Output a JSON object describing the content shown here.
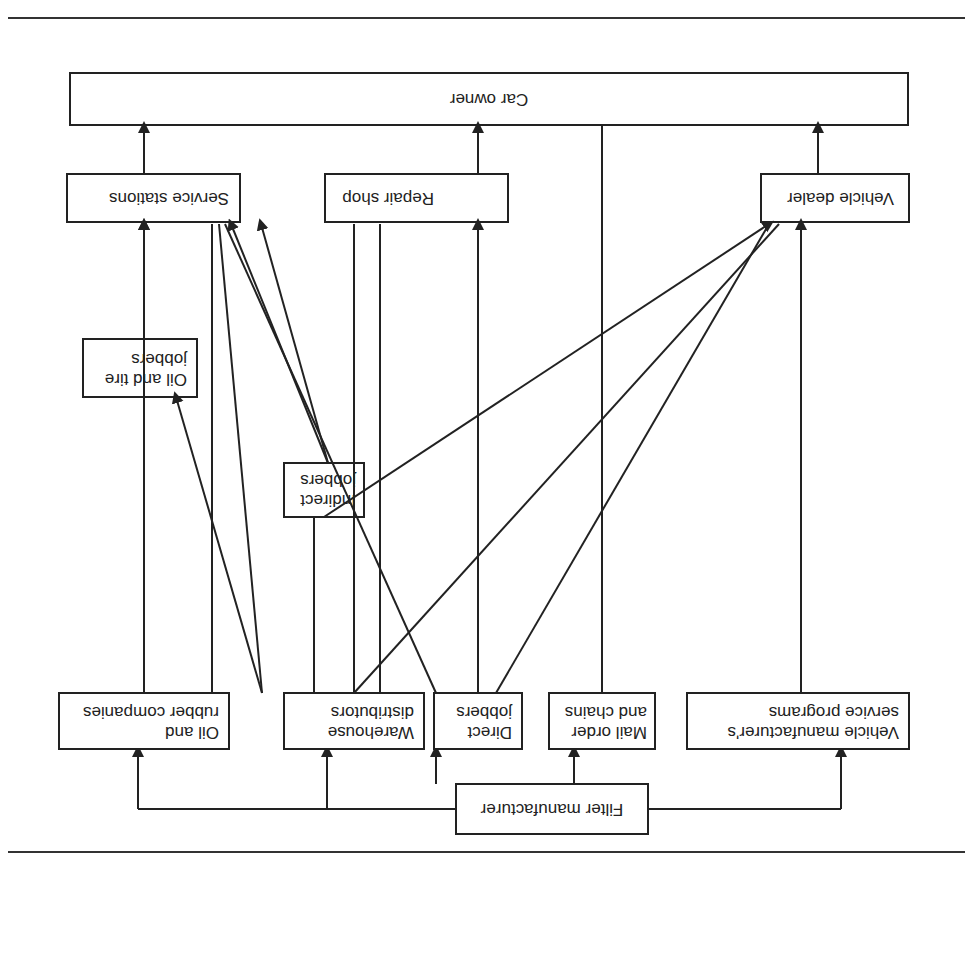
{
  "diagram": {
    "orientation": "rotated-180",
    "nodes": {
      "car_owner": "Car owner",
      "service_stations": "Service stations",
      "repair_shop": "Repair shop",
      "vehicle_dealer": "Vehicle dealer",
      "oil_tire_jobbers_1": "Oil and tire",
      "oil_tire_jobbers_2": "jobbers",
      "indirect_jobbers_1": "Indirect",
      "indirect_jobbers_2": "jobbers",
      "oil_rubber_1": "Oil and",
      "oil_rubber_2": "rubber companies",
      "warehouse_1": "Warehouse",
      "warehouse_2": "distributors",
      "direct_jobbers_1": "Direct",
      "direct_jobbers_2": "jobbers",
      "mail_order_1": "Mail order",
      "mail_order_2": "and chains",
      "vmsp_1": "Vehicle manufacturer's",
      "vmsp_2": "service programs",
      "filter_manufacturer": "Filter manufacturer"
    },
    "edges": [
      [
        "Filter manufacturer",
        "Oil and rubber companies"
      ],
      [
        "Filter manufacturer",
        "Warehouse distributors"
      ],
      [
        "Filter manufacturer",
        "Direct jobbers"
      ],
      [
        "Filter manufacturer",
        "Mail order and chains"
      ],
      [
        "Filter manufacturer",
        "Vehicle manufacturer's service programs"
      ],
      [
        "Oil and rubber companies",
        "Oil and tire jobbers"
      ],
      [
        "Oil and rubber companies",
        "Service stations"
      ],
      [
        "Oil and tire jobbers",
        "Service stations"
      ],
      [
        "Warehouse distributors",
        "Oil and tire jobbers"
      ],
      [
        "Warehouse distributors",
        "Service stations"
      ],
      [
        "Warehouse distributors",
        "Indirect jobbers"
      ],
      [
        "Warehouse distributors",
        "Repair shop"
      ],
      [
        "Warehouse distributors",
        "Vehicle dealer"
      ],
      [
        "Indirect jobbers",
        "Service stations"
      ],
      [
        "Indirect jobbers",
        "Repair shop"
      ],
      [
        "Indirect jobbers",
        "Vehicle dealer"
      ],
      [
        "Direct jobbers",
        "Service stations"
      ],
      [
        "Direct jobbers",
        "Repair shop"
      ],
      [
        "Direct jobbers",
        "Vehicle dealer"
      ],
      [
        "Mail order and chains",
        "Car owner"
      ],
      [
        "Vehicle manufacturer's service programs",
        "Vehicle dealer"
      ],
      [
        "Service stations",
        "Car owner"
      ],
      [
        "Repair shop",
        "Car owner"
      ],
      [
        "Vehicle dealer",
        "Car owner"
      ]
    ]
  }
}
